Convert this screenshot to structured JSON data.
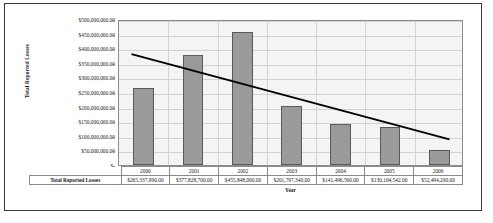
{
  "chart_data": {
    "type": "bar",
    "title": "",
    "xlabel": "Year",
    "ylabel": "Total Reported Losses",
    "categories": [
      "2000",
      "2001",
      "2002",
      "2003",
      "2004",
      "2005",
      "2006"
    ],
    "values": [
      265337990.0,
      377828700.0,
      455848000.0,
      201797340.0,
      141496560.0,
      130104542.0,
      52494290.0
    ],
    "value_labels": [
      "$265,337,990.00",
      "$377,828,700.00",
      "$455,848,000.00",
      "$201,797,340.00",
      "$141,496,560.00",
      "$130,104,542.00",
      "$52,494,290.00"
    ],
    "series": [
      {
        "name": "Total Reported Losses",
        "values": [
          265337990.0,
          377828700.0,
          455848000.0,
          201797340.0,
          141496560.0,
          130104542.0,
          52494290.0
        ]
      },
      {
        "name": "trendline",
        "type": "line",
        "x": [
          "2000",
          "2006"
        ],
        "values": [
          386000000,
          92000000
        ]
      }
    ],
    "ylim": [
      0,
      500000000
    ],
    "ytick_labels": [
      "$500,000,000.00",
      "$450,000,000.00",
      "$400,000,000.00",
      "$350,000,000.00",
      "$300,000,000.00",
      "$250,000,000.00",
      "$200,000,000.00",
      "$150,000,000.00",
      "$100,000,000.00",
      "$50,000,000.00",
      "$-"
    ],
    "ytick_values": [
      500000000,
      450000000,
      400000000,
      350000000,
      300000000,
      250000000,
      200000000,
      150000000,
      100000000,
      50000000,
      0
    ],
    "grid": true,
    "legend": "none",
    "bar_color": "#9a9a9a",
    "bar_border_color": "#595959",
    "trendline_color": "#000000",
    "plot_background": "#f4f4f4",
    "gridline_color": "#d2d2d2"
  },
  "data_table": {
    "row_label": "Total Reported Losses",
    "columns": [
      "2000",
      "2001",
      "2002",
      "2003",
      "2004",
      "2005",
      "2006"
    ],
    "values": [
      "$265,337,990.00",
      "$377,828,700.00",
      "$455,848,000.00",
      "$201,797,340.00",
      "$141,496,560.00",
      "$130,104,542.00",
      "$52,494,290.00"
    ]
  },
  "axes": {
    "y_title": "Total Reported Losses",
    "x_title": "Year"
  }
}
